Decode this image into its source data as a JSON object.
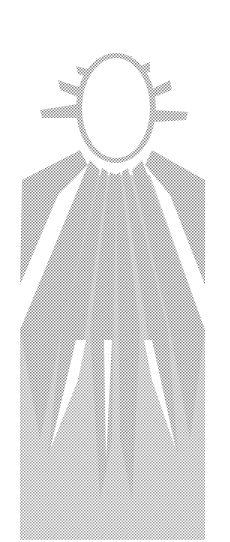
{
  "illustration": {
    "subject": "stippled sun with radiating rays",
    "icon": "sun-icon",
    "colors": {
      "background": "#ffffff",
      "stipple": "#8a8a8a",
      "sun_fill": "#ffffff"
    }
  }
}
